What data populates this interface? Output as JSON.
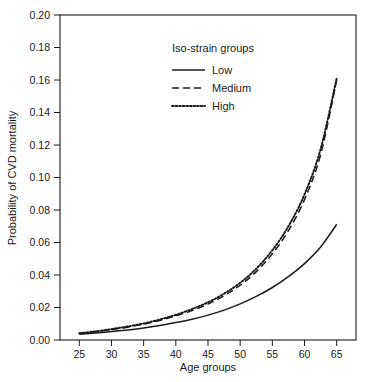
{
  "chart_data": {
    "type": "line",
    "title": "",
    "xlabel": "Age groups",
    "ylabel": "Probability of CVD mortality",
    "xlim": [
      22,
      68
    ],
    "ylim": [
      0.0,
      0.2
    ],
    "xticks": [
      25,
      30,
      35,
      40,
      45,
      50,
      55,
      60,
      65
    ],
    "xtick_labels": [
      "25",
      "30",
      "35",
      "40",
      "45",
      "50",
      "55",
      "60",
      "65"
    ],
    "yticks": [
      0.0,
      0.02,
      0.04,
      0.06,
      0.08,
      0.1,
      0.12,
      0.14,
      0.16,
      0.18,
      0.2
    ],
    "ytick_labels": [
      "0.00",
      "0.02",
      "0.04",
      "0.06",
      "0.08",
      "0.10",
      "0.12",
      "0.14",
      "0.16",
      "0.18",
      "0.20"
    ],
    "grid": false,
    "legend_position": "upper-center",
    "legend_title": "Iso-strain groups",
    "x": [
      25,
      27.5,
      30,
      32.5,
      35,
      37.5,
      40,
      42.5,
      45,
      47.5,
      50,
      52.5,
      55,
      57.5,
      60,
      62.5,
      65
    ],
    "series": [
      {
        "name": "Low",
        "style": "solid",
        "color": "#1a1a1a",
        "values": [
          0.0035,
          0.0043,
          0.0052,
          0.0062,
          0.0074,
          0.0089,
          0.0107,
          0.0128,
          0.0153,
          0.0184,
          0.0222,
          0.0268,
          0.0323,
          0.039,
          0.047,
          0.0572,
          0.0712
        ]
      },
      {
        "name": "Medium",
        "style": "dashed",
        "color": "#1a1a1a",
        "values": [
          0.004,
          0.0051,
          0.0064,
          0.0079,
          0.0097,
          0.012,
          0.0148,
          0.0181,
          0.0221,
          0.0272,
          0.0337,
          0.0421,
          0.053,
          0.0673,
          0.0864,
          0.114,
          0.16
        ]
      },
      {
        "name": "High",
        "style": "dotted",
        "color": "#1a1a1a",
        "values": [
          0.0042,
          0.0053,
          0.0067,
          0.0083,
          0.0102,
          0.0126,
          0.0155,
          0.019,
          0.0232,
          0.0285,
          0.0352,
          0.0439,
          0.0552,
          0.07,
          0.0896,
          0.1175,
          0.161
        ]
      }
    ]
  },
  "legend": {
    "title": "Iso-strain groups",
    "items": [
      {
        "label": "Low",
        "style": "solid"
      },
      {
        "label": "Medium",
        "style": "dashed"
      },
      {
        "label": "High",
        "style": "dotted"
      }
    ]
  },
  "axes": {
    "x_title": "Age groups",
    "y_title": "Probability of CVD mortality"
  }
}
